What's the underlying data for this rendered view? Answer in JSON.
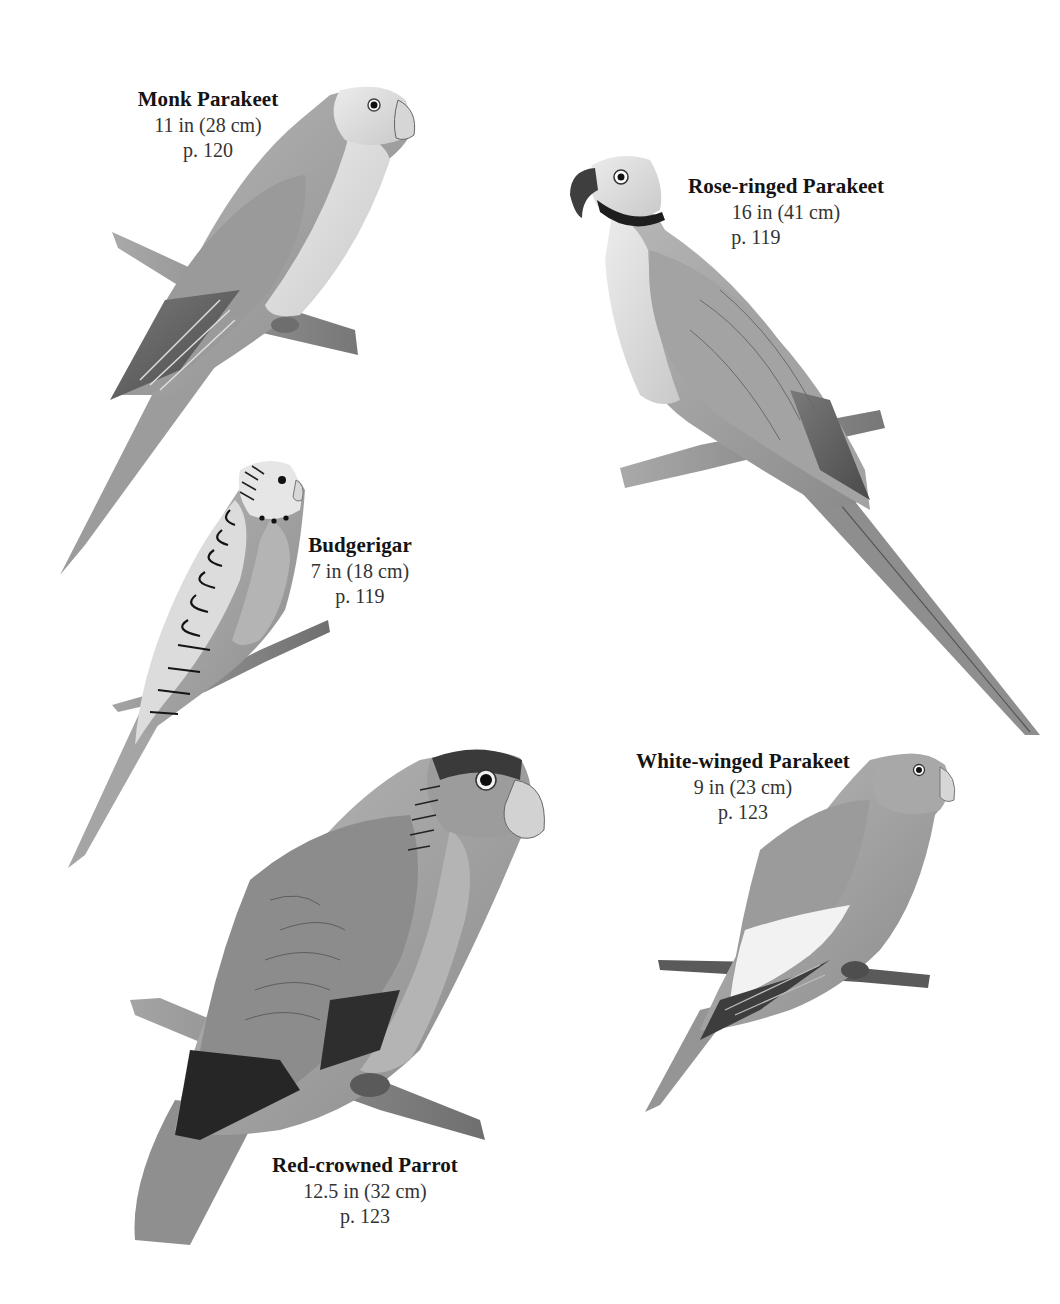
{
  "plate": {
    "background": "#ffffff",
    "species": [
      {
        "id": "monk-parakeet",
        "name": "Monk Parakeet",
        "size": "11 in (28 cm)",
        "page": "p. 120"
      },
      {
        "id": "rose-ringed-parakeet",
        "name": "Rose-ringed Parakeet",
        "size": "16 in (41 cm)",
        "page": "p. 119"
      },
      {
        "id": "budgerigar",
        "name": "Budgerigar",
        "size": "7 in (18 cm)",
        "page": "p. 119"
      },
      {
        "id": "white-winged-parakeet",
        "name": "White-winged Parakeet",
        "size": "9 in (23 cm)",
        "page": "p. 123"
      },
      {
        "id": "red-crowned-parrot",
        "name": "Red-crowned Parrot",
        "size": "12.5 in (32 cm)",
        "page": "p. 123"
      }
    ]
  }
}
